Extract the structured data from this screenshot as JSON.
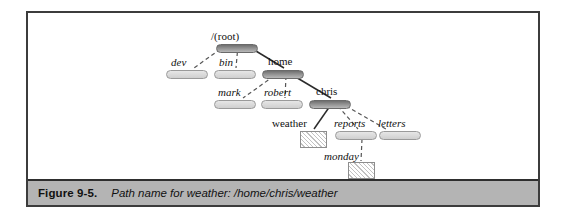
{
  "figure": {
    "caption_label": "Figure 9-5.",
    "caption_text": "Path name for weather: /home/chris/weather",
    "frame_color": "#3c3c3c",
    "caption_bar_color": "#b4b4b4"
  },
  "diagram": {
    "type": "filesystem-tree",
    "highlighted_path": "/home/chris/weather",
    "node_kinds": {
      "directory": "rounded-bar",
      "file": "hatched-rectangle"
    },
    "nodes": [
      {
        "id": "root",
        "label": "/(root)",
        "kind": "directory",
        "on_path": true,
        "italic": false
      },
      {
        "id": "dev",
        "label": "dev",
        "kind": "directory",
        "on_path": false,
        "italic": true
      },
      {
        "id": "bin",
        "label": "bin",
        "kind": "directory",
        "on_path": false,
        "italic": true
      },
      {
        "id": "home",
        "label": "home",
        "kind": "directory",
        "on_path": true,
        "italic": false
      },
      {
        "id": "mark",
        "label": "mark",
        "kind": "directory",
        "on_path": false,
        "italic": true
      },
      {
        "id": "robert",
        "label": "robert",
        "kind": "directory",
        "on_path": false,
        "italic": true
      },
      {
        "id": "chris",
        "label": "chris",
        "kind": "directory",
        "on_path": true,
        "italic": false
      },
      {
        "id": "weather",
        "label": "weather",
        "kind": "file",
        "on_path": true,
        "italic": false
      },
      {
        "id": "reports",
        "label": "reports",
        "kind": "directory",
        "on_path": false,
        "italic": true
      },
      {
        "id": "letters",
        "label": "letters",
        "kind": "directory",
        "on_path": false,
        "italic": true
      },
      {
        "id": "monday",
        "label": "monday",
        "kind": "file",
        "on_path": false,
        "italic": true
      }
    ],
    "edges": [
      {
        "from": "root",
        "to": "dev",
        "style": "dashed"
      },
      {
        "from": "root",
        "to": "bin",
        "style": "dashed"
      },
      {
        "from": "root",
        "to": "home",
        "style": "solid"
      },
      {
        "from": "home",
        "to": "mark",
        "style": "dashed"
      },
      {
        "from": "home",
        "to": "robert",
        "style": "dashed"
      },
      {
        "from": "home",
        "to": "chris",
        "style": "solid"
      },
      {
        "from": "chris",
        "to": "weather",
        "style": "solid"
      },
      {
        "from": "chris",
        "to": "reports",
        "style": "dashed"
      },
      {
        "from": "chris",
        "to": "letters",
        "style": "dashed"
      },
      {
        "from": "reports",
        "to": "monday",
        "style": "dashed"
      }
    ]
  }
}
